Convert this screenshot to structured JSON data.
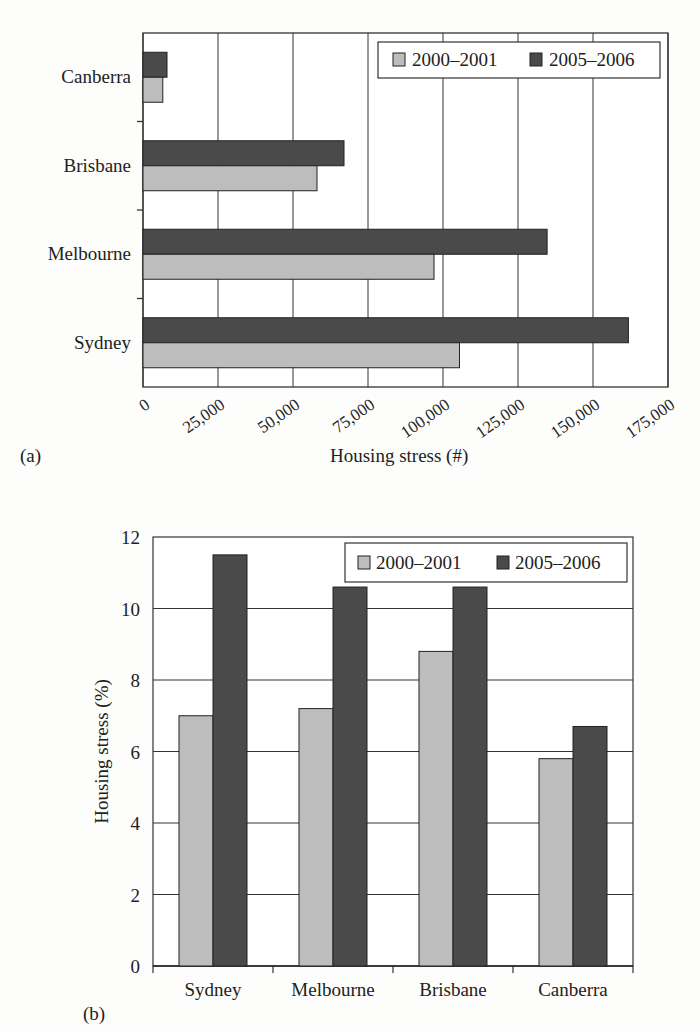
{
  "chart_data": [
    {
      "panel": "(a)",
      "type": "bar",
      "orientation": "horizontal",
      "title": "",
      "categories": [
        "Canberra",
        "Brisbane",
        "Melbourne",
        "Sydney"
      ],
      "series": [
        {
          "name": "2000–2001",
          "color": "#bdbdbd",
          "values": [
            6600,
            58000,
            97000,
            105500
          ]
        },
        {
          "name": "2005–2006",
          "color": "#4a4a4a",
          "values": [
            8000,
            67000,
            134700,
            161800
          ]
        }
      ],
      "xlabel": "Housing stress (#)",
      "ylabel": "",
      "xlim": [
        0,
        175000
      ],
      "xticks": [
        0,
        25000,
        50000,
        75000,
        100000,
        125000,
        150000,
        175000
      ],
      "xtick_labels": [
        "0",
        "25,000",
        "50,000",
        "75,000",
        "100,000",
        "125,000",
        "150,000",
        "175,000"
      ],
      "grid": "vertical",
      "legend_position": "top-right"
    },
    {
      "panel": "(b)",
      "type": "bar",
      "orientation": "vertical",
      "title": "",
      "categories": [
        "Sydney",
        "Melbourne",
        "Brisbane",
        "Canberra"
      ],
      "series": [
        {
          "name": "2000–2001",
          "color": "#bdbdbd",
          "values": [
            7.0,
            7.2,
            8.8,
            5.8
          ]
        },
        {
          "name": "2005–2006",
          "color": "#4a4a4a",
          "values": [
            11.5,
            10.6,
            10.6,
            6.7
          ]
        }
      ],
      "xlabel": "",
      "ylabel": "Housing stress (%)",
      "ylim": [
        0,
        12
      ],
      "yticks": [
        0,
        2,
        4,
        6,
        8,
        10,
        12
      ],
      "grid": "horizontal",
      "legend_position": "top-right"
    }
  ],
  "labels": {
    "panel_a": "(a)",
    "panel_b": "(b)",
    "xlabel_a": "Housing stress (#)",
    "ylabel_b": "Housing stress (%)"
  }
}
